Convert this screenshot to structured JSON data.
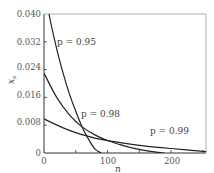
{
  "chart_data": {
    "type": "line",
    "title": "",
    "xlabel": "n",
    "ylabel": "x_s",
    "xlim": [
      0,
      255
    ],
    "ylim": [
      0,
      0.04
    ],
    "x_ticks": [
      "0",
      "100",
      "200"
    ],
    "y_ticks": [
      "0",
      "0.008",
      "0.016",
      "0.024",
      "0.032",
      "0.040"
    ],
    "grid": false,
    "legend": "inline annotations",
    "series": [
      {
        "name": "p=0.95",
        "label": "p=0.95",
        "x": [
          0,
          10,
          20,
          30,
          40,
          50,
          60,
          70,
          80,
          90
        ],
        "y": [
          0.048,
          0.038,
          0.03,
          0.023,
          0.017,
          0.012,
          0.0075,
          0.004,
          0.0012,
          0.0
        ]
      },
      {
        "name": "p=0.98",
        "label": "p=0.98",
        "x": [
          0,
          20,
          40,
          60,
          80,
          100,
          120,
          140,
          160,
          180,
          190
        ],
        "y": [
          0.023,
          0.016,
          0.011,
          0.0075,
          0.0052,
          0.0036,
          0.0024,
          0.0014,
          0.0007,
          0.0002,
          0.0
        ]
      },
      {
        "name": "p=0.99",
        "label": "p=0.99",
        "x": [
          0,
          40,
          80,
          120,
          160,
          200,
          255
        ],
        "y": [
          0.0098,
          0.0065,
          0.0043,
          0.003,
          0.002,
          0.0013,
          0.0004
        ]
      }
    ],
    "annotations": [
      {
        "text": "p = 0.95",
        "x": 20,
        "y": 0.032
      },
      {
        "text": "p = 0.98",
        "x": 60,
        "y": 0.0098
      },
      {
        "text": "p = 0.99",
        "x": 160,
        "y": 0.0045
      }
    ]
  },
  "labels": {
    "x_axis": "n",
    "y_axis": "x",
    "y_axis_sub": "s",
    "ann_095": "p = 0.95",
    "ann_098": "p = 0.98",
    "ann_099": "p = 0.99"
  }
}
